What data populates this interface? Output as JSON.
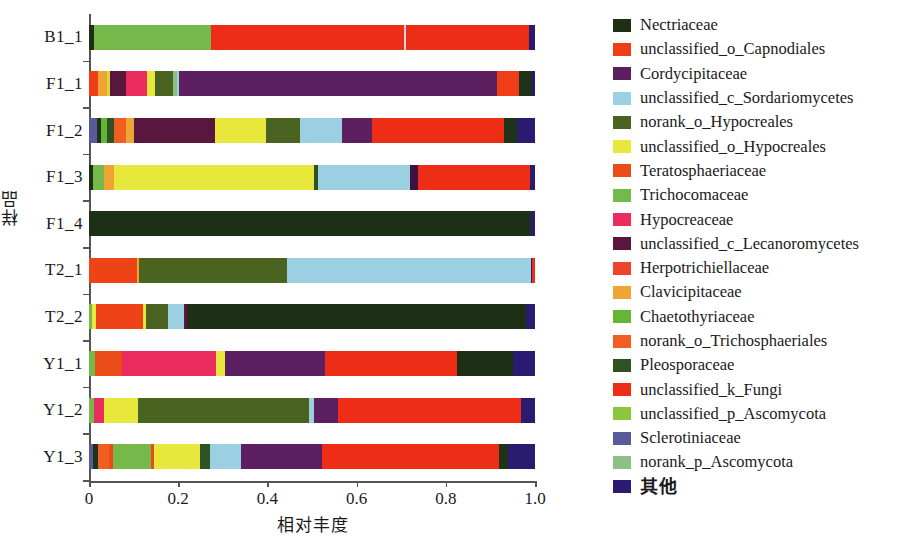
{
  "chart_data": {
    "type": "bar",
    "orientation": "horizontal",
    "stacked": true,
    "normalized": true,
    "title": "",
    "xlabel": "相对丰度",
    "ylabel": "样品",
    "xlim": [
      0,
      1.0
    ],
    "xticks": [
      "0",
      "0.2",
      "0.4",
      "0.6",
      "0.8",
      "1.0"
    ],
    "xtick_values": [
      0,
      0.2,
      0.4,
      0.6,
      0.8,
      1.0
    ],
    "grid": false,
    "legend_position": "right",
    "categories": [
      "B1_1",
      "F1_1",
      "F1_2",
      "F1_3",
      "F1_4",
      "T2_1",
      "T2_2",
      "Y1_1",
      "Y1_2",
      "Y1_3"
    ],
    "series": [
      {
        "name": "Nectriaceae",
        "color": "#1d3015",
        "values": [
          0.011,
          0.0,
          0.0,
          0.0,
          0.99,
          0.0,
          0.79,
          0.125,
          0.0,
          0.0
        ]
      },
      {
        "name": "unclassified_o_Capnodiales",
        "color": "#ee3d17",
        "values": [
          0.0,
          0.048,
          0.0,
          0.0,
          0.0,
          0.11,
          0.105,
          0.0,
          0.0,
          0.0
        ]
      },
      {
        "name": "Cordycipitaceae",
        "color": "#5c1f60",
        "values": [
          0.0,
          0.712,
          0.0,
          0.018,
          0.0,
          0.0,
          0.008,
          0.225,
          0.055,
          0.18
        ]
      },
      {
        "name": "unclassified_c_Sordariomycetes",
        "color": "#9bd0e3",
        "values": [
          0.0,
          0.0,
          0.095,
          0.205,
          0.0,
          0.445,
          0.035,
          0.0,
          0.01,
          0.07
        ]
      },
      {
        "name": "norank_o_Hypocreales",
        "color": "#4b6321",
        "values": [
          0.0,
          0.04,
          0.075,
          0.009,
          0.0,
          0.335,
          0.05,
          0.0,
          0.385,
          0.022
        ]
      },
      {
        "name": "unclassified_o_Hypocreales",
        "color": "#e8e83c",
        "values": [
          0.0,
          0.026,
          0.115,
          0.45,
          0.0,
          0.0,
          0.009,
          0.02,
          0.075,
          0.105
        ]
      },
      {
        "name": "Teratosphaeriaceae",
        "color": "#ea4b19",
        "values": [
          0.0,
          0.0,
          0.018,
          0.018,
          0.0,
          0.0,
          0.0,
          0.06,
          0.0,
          0.03
        ]
      },
      {
        "name": "Trichocomaceae",
        "color": "#74b94a",
        "values": [
          0.262,
          0.0,
          0.0,
          0.025,
          0.0,
          0.0,
          0.006,
          0.013,
          0.012,
          0.085
        ]
      },
      {
        "name": "Hypocreaceae",
        "color": "#ea2d5e",
        "values": [
          0.0,
          0.066,
          0.0,
          0.0,
          0.0,
          0.0,
          0.0,
          0.212,
          0.022,
          0.009
        ]
      },
      {
        "name": "unclassified_c_Lecanoromycetes",
        "color": "#59173d",
        "values": [
          0.0,
          0.036,
          0.23,
          0.0,
          0.0,
          0.0,
          0.007,
          0.0,
          0.0,
          0.0
        ]
      },
      {
        "name": "Herpotrichiellaceae",
        "color": "#ed4430",
        "values": [
          0.0,
          0.0,
          0.0,
          0.0,
          0.0,
          0.0,
          0.0,
          0.0,
          0.0,
          0.0
        ]
      },
      {
        "name": "Clavicipitaceae",
        "color": "#efa434",
        "values": [
          0.0,
          0.027,
          0.02,
          0.022,
          0.0,
          0.0,
          0.0,
          0.0,
          0.0,
          0.0
        ]
      },
      {
        "name": "Chaetothyriaceae",
        "color": "#66b635",
        "values": [
          0.0,
          0.0,
          0.012,
          0.0,
          0.0,
          0.0,
          0.01,
          0.0,
          0.0,
          0.0
        ]
      },
      {
        "name": "norank_o_Trichosphaeriales",
        "color": "#ee5f21",
        "values": [
          0.0,
          0.0,
          0.026,
          0.0,
          0.0,
          0.0,
          0.0,
          0.0,
          0.0,
          0.024
        ]
      },
      {
        "name": "Pleosporaceae",
        "color": "#2e5222",
        "values": [
          0.0,
          0.029,
          0.016,
          0.0,
          0.0,
          0.0,
          0.0,
          0.0,
          0.0,
          0.02
        ]
      },
      {
        "name": "unclassified_k_Fungi",
        "color": "#ed2d16",
        "values": [
          0.713,
          0.0,
          0.33,
          0.235,
          0.0,
          0.0,
          0.0,
          0.295,
          0.41,
          0.375
        ]
      },
      {
        "name": "unclassified_p_Ascomycota",
        "color": "#8cc63e",
        "values": [
          0.0,
          0.0,
          0.0,
          0.0,
          0.0,
          0.0,
          0.0,
          0.0,
          0.0,
          0.0
        ]
      },
      {
        "name": "Sclerotiniaceae",
        "color": "#585a9c",
        "values": [
          0.0,
          0.0,
          0.019,
          0.0,
          0.0,
          0.0,
          0.0,
          0.0,
          0.0,
          0.02
        ]
      },
      {
        "name": "norank_p_Ascomycota",
        "color": "#8dc085",
        "values": [
          0.0,
          0.0,
          0.0,
          0.0,
          0.0,
          0.0,
          0.0,
          0.0,
          0.0,
          0.0
        ]
      },
      {
        "name": "其他",
        "color": "#2b1b70",
        "values": [
          0.014,
          0.016,
          0.044,
          0.018,
          0.01,
          0.11,
          0.02,
          0.05,
          0.031,
          0.06
        ]
      }
    ]
  },
  "axes": {
    "y_title": "样品",
    "x_title": "相对丰度",
    "y_categories": [
      "B1_1",
      "F1_1",
      "F1_2",
      "F1_3",
      "F1_4",
      "T2_1",
      "T2_2",
      "Y1_1",
      "Y1_2",
      "Y1_3"
    ],
    "x_ticks": [
      "0",
      "0.2",
      "0.4",
      "0.6",
      "0.8",
      "1.0"
    ]
  },
  "legend": {
    "items": [
      {
        "label": "Nectriaceae",
        "color": "#1d3015"
      },
      {
        "label": "unclassified_o_Capnodiales",
        "color": "#ee3d17"
      },
      {
        "label": "Cordycipitaceae",
        "color": "#5c1f60"
      },
      {
        "label": "unclassified_c_Sordariomycetes",
        "color": "#9bd0e3"
      },
      {
        "label": "norank_o_Hypocreales",
        "color": "#4b6321"
      },
      {
        "label": "unclassified_o_Hypocreales",
        "color": "#e8e83c"
      },
      {
        "label": "Teratosphaeriaceae",
        "color": "#ea4b19"
      },
      {
        "label": "Trichocomaceae",
        "color": "#74b94a"
      },
      {
        "label": "Hypocreaceae",
        "color": "#ea2d5e"
      },
      {
        "label": "unclassified_c_Lecanoromycetes",
        "color": "#59173d"
      },
      {
        "label": "Herpotrichiellaceae",
        "color": "#ed4430"
      },
      {
        "label": "Clavicipitaceae",
        "color": "#efa434"
      },
      {
        "label": "Chaetothyriaceae",
        "color": "#66b635"
      },
      {
        "label": "norank_o_Trichosphaeriales",
        "color": "#ee5f21"
      },
      {
        "label": "Pleosporaceae",
        "color": "#2e5222"
      },
      {
        "label": "unclassified_k_Fungi",
        "color": "#ed2d16"
      },
      {
        "label": "unclassified_p_Ascomycota",
        "color": "#8cc63e"
      },
      {
        "label": "Sclerotiniaceae",
        "color": "#585a9c"
      },
      {
        "label": "norank_p_Ascomycota",
        "color": "#8dc085"
      },
      {
        "label": "其他",
        "color": "#2b1b70"
      }
    ]
  },
  "bar_segments": {
    "B1_1": [
      {
        "name": "Nectriaceae",
        "color": "#1d3015",
        "width": 0.012
      },
      {
        "name": "Trichocomaceae",
        "color": "#74b94a",
        "width": 0.262
      },
      {
        "name": "unclassified_k_Fungi",
        "color": "#ed2d16",
        "width": 0.432
      },
      {
        "name": "unclassified_c_Sordariomycetes",
        "color": "#c8d8e0",
        "width": 0.004
      },
      {
        "name": "unclassified_k_Fungi",
        "color": "#ed2d16",
        "width": 0.276
      },
      {
        "name": "其他",
        "color": "#2b1b70",
        "width": 0.014
      }
    ],
    "F1_1": [
      {
        "name": "unclassified_o_Capnodiales",
        "color": "#ee3d17",
        "width": 0.021
      },
      {
        "name": "Clavicipitaceae",
        "color": "#efa434",
        "width": 0.02
      },
      {
        "name": "unclassified_o_Hypocreales",
        "color": "#d8d83a",
        "width": 0.007
      },
      {
        "name": "unclassified_c_Lecanoromycetes",
        "color": "#59173d",
        "width": 0.036
      },
      {
        "name": "Hypocreaceae",
        "color": "#ea2d5e",
        "width": 0.046
      },
      {
        "name": "unclassified_o_Hypocreales",
        "color": "#e8e83c",
        "width": 0.019
      },
      {
        "name": "norank_o_Hypocreales",
        "color": "#4b6321",
        "width": 0.04
      },
      {
        "name": "norank_p_Ascomycota",
        "color": "#8dc085",
        "width": 0.008
      },
      {
        "name": "unclassified_c_Sordariomycetes",
        "color": "#9bd0e3",
        "width": 0.006
      },
      {
        "name": "Cordycipitaceae",
        "color": "#5c1f60",
        "width": 0.712
      },
      {
        "name": "unclassified_k_Fungi",
        "color": "#ee3d17",
        "width": 0.049
      },
      {
        "name": "Pleosporaceae",
        "color": "#1f3318",
        "width": 0.029
      },
      {
        "name": "其他",
        "color": "#2b1b70",
        "width": 0.007
      }
    ],
    "F1_2": [
      {
        "name": "Sclerotiniaceae",
        "color": "#585a9c",
        "width": 0.019
      },
      {
        "name": "Pleosporaceae",
        "color": "#1f3318",
        "width": 0.009
      },
      {
        "name": "Chaetothyriaceae",
        "color": "#66b635",
        "width": 0.012
      },
      {
        "name": "Pleosporaceae",
        "color": "#2e5222",
        "width": 0.016
      },
      {
        "name": "norank_o_Trichosphaeriales",
        "color": "#ee5f21",
        "width": 0.026
      },
      {
        "name": "Clavicipitaceae",
        "color": "#efa434",
        "width": 0.02
      },
      {
        "name": "unclassified_c_Lecanoromycetes",
        "color": "#59173d",
        "width": 0.181
      },
      {
        "name": "unclassified_o_Hypocreales",
        "color": "#e8e83c",
        "width": 0.115
      },
      {
        "name": "norank_o_Hypocreales",
        "color": "#4b6321",
        "width": 0.075
      },
      {
        "name": "unclassified_c_Sordariomycetes",
        "color": "#9bd0e3",
        "width": 0.095
      },
      {
        "name": "Cordycipitaceae",
        "color": "#5c1f60",
        "width": 0.066
      },
      {
        "name": "unclassified_k_Fungi",
        "color": "#ed2d16",
        "width": 0.297
      },
      {
        "name": "Pleosporaceae",
        "color": "#1f3318",
        "width": 0.029
      },
      {
        "name": "其他",
        "color": "#2b1b70",
        "width": 0.04
      }
    ],
    "F1_3": [
      {
        "name": "Nectriaceae",
        "color": "#1d3015",
        "width": 0.008
      },
      {
        "name": "Trichocomaceae",
        "color": "#74b94a",
        "width": 0.025
      },
      {
        "name": "Clavicipitaceae",
        "color": "#efa434",
        "width": 0.022
      },
      {
        "name": "unclassified_o_Hypocreales",
        "color": "#e8e83c",
        "width": 0.45
      },
      {
        "name": "norank_o_Hypocreales",
        "color": "#2e5222",
        "width": 0.009
      },
      {
        "name": "unclassified_c_Sordariomycetes",
        "color": "#9bd0e3",
        "width": 0.205
      },
      {
        "name": "Cordycipitaceae",
        "color": "#3d1140",
        "width": 0.018
      },
      {
        "name": "unclassified_k_Fungi",
        "color": "#ed2d16",
        "width": 0.253
      },
      {
        "name": "其他",
        "color": "#2b1b70",
        "width": 0.01
      }
    ],
    "F1_4": [
      {
        "name": "Nectriaceae",
        "color": "#1d3015",
        "width": 0.99
      },
      {
        "name": "其他",
        "color": "#2b1b70",
        "width": 0.01
      }
    ],
    "T2_1": [
      {
        "name": "unclassified_o_Capnodiales",
        "color": "#ee4217",
        "width": 0.108
      },
      {
        "name": "Clavicipitaceae",
        "color": "#efa434",
        "width": 0.004
      },
      {
        "name": "norank_o_Hypocreales",
        "color": "#4b6321",
        "width": 0.333
      },
      {
        "name": "unclassified_c_Sordariomycetes",
        "color": "#9bd0e3",
        "width": 0.545
      },
      {
        "name": "其他",
        "color": "#2b1b70",
        "width": 0.004
      },
      {
        "name": "unclassified_k_Fungi",
        "color": "#ed2d16",
        "width": 0.006
      }
    ],
    "T2_2": [
      {
        "name": "Trichocomaceae",
        "color": "#74b94a",
        "width": 0.006
      },
      {
        "name": "unclassified_o_Hypocreales",
        "color": "#e8e83c",
        "width": 0.009
      },
      {
        "name": "unclassified_o_Capnodiales",
        "color": "#ee4217",
        "width": 0.105
      },
      {
        "name": "unclassified_o_Hypocreales",
        "color": "#e8e83c",
        "width": 0.007
      },
      {
        "name": "norank_o_Hypocreales",
        "color": "#4b6321",
        "width": 0.05
      },
      {
        "name": "unclassified_c_Sordariomycetes",
        "color": "#9bd0e3",
        "width": 0.035
      },
      {
        "name": "unclassified_c_Lecanoromycetes",
        "color": "#59173d",
        "width": 0.007
      },
      {
        "name": "Nectriaceae",
        "color": "#1d3015",
        "width": 0.761
      },
      {
        "name": "其他",
        "color": "#2b1b70",
        "width": 0.02
      }
    ],
    "Y1_1": [
      {
        "name": "Trichocomaceae",
        "color": "#74b94a",
        "width": 0.013
      },
      {
        "name": "Teratosphaeriaceae",
        "color": "#ea4b19",
        "width": 0.06
      },
      {
        "name": "Hypocreaceae",
        "color": "#ea2d5e",
        "width": 0.212
      },
      {
        "name": "unclassified_o_Hypocreales",
        "color": "#e8e83c",
        "width": 0.02
      },
      {
        "name": "Cordycipitaceae",
        "color": "#5c1f60",
        "width": 0.225
      },
      {
        "name": "unclassified_k_Fungi",
        "color": "#ed2d16",
        "width": 0.295
      },
      {
        "name": "Nectriaceae",
        "color": "#1d3015",
        "width": 0.125
      },
      {
        "name": "其他",
        "color": "#2b1b70",
        "width": 0.05
      }
    ],
    "Y1_2": [
      {
        "name": "Trichocomaceae",
        "color": "#74b94a",
        "width": 0.012
      },
      {
        "name": "Hypocreaceae",
        "color": "#ea2d5e",
        "width": 0.022
      },
      {
        "name": "unclassified_o_Hypocreales",
        "color": "#e8e83c",
        "width": 0.075
      },
      {
        "name": "norank_o_Hypocreales",
        "color": "#4b6321",
        "width": 0.385
      },
      {
        "name": "unclassified_c_Sordariomycetes",
        "color": "#9bd0e3",
        "width": 0.01
      },
      {
        "name": "Cordycipitaceae",
        "color": "#5c1f60",
        "width": 0.055
      },
      {
        "name": "unclassified_k_Fungi",
        "color": "#ed2d16",
        "width": 0.41
      },
      {
        "name": "其他",
        "color": "#2b1b70",
        "width": 0.031
      }
    ],
    "Y1_3": [
      {
        "name": "Sclerotiniaceae",
        "color": "#585a9c",
        "width": 0.008
      },
      {
        "name": "Pleosporaceae",
        "color": "#1f3318",
        "width": 0.012
      },
      {
        "name": "norank_o_Trichosphaeriales",
        "color": "#ee5f21",
        "width": 0.024
      },
      {
        "name": "Teratosphaeriaceae",
        "color": "#ea4b19",
        "width": 0.009
      },
      {
        "name": "Trichocomaceae",
        "color": "#74b94a",
        "width": 0.085
      },
      {
        "name": "Teratosphaeriaceae",
        "color": "#ea4b19",
        "width": 0.007
      },
      {
        "name": "unclassified_o_Hypocreales",
        "color": "#e8e83c",
        "width": 0.105
      },
      {
        "name": "norank_o_Hypocreales",
        "color": "#2e5222",
        "width": 0.022
      },
      {
        "name": "unclassified_c_Sordariomycetes",
        "color": "#9bd0e3",
        "width": 0.07
      },
      {
        "name": "Cordycipitaceae",
        "color": "#5c1f60",
        "width": 0.18
      },
      {
        "name": "unclassified_k_Fungi",
        "color": "#ed2d16",
        "width": 0.398
      },
      {
        "name": "Pleosporaceae",
        "color": "#1f3318",
        "width": 0.02
      },
      {
        "name": "其他",
        "color": "#2b1b70",
        "width": 0.06
      }
    ]
  }
}
